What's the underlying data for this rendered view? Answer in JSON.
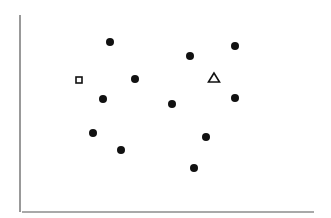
{
  "chart_data": {
    "type": "scatter",
    "title": "",
    "xlabel": "",
    "ylabel": "",
    "grid": false,
    "legend": null,
    "axes": {
      "y_axis": {
        "x": 20,
        "y1": 15,
        "y2": 212
      },
      "x_axis": {
        "y": 212,
        "x1": 22,
        "x2": 314
      },
      "color": "#555555"
    },
    "series": [
      {
        "name": "filled-circles",
        "marker": "circle",
        "color": "#111111",
        "points": [
          {
            "x": 110,
            "y": 42
          },
          {
            "x": 190,
            "y": 56
          },
          {
            "x": 235,
            "y": 46
          },
          {
            "x": 135,
            "y": 79
          },
          {
            "x": 103,
            "y": 99
          },
          {
            "x": 172,
            "y": 104
          },
          {
            "x": 235,
            "y": 98
          },
          {
            "x": 93,
            "y": 133
          },
          {
            "x": 121,
            "y": 150
          },
          {
            "x": 206,
            "y": 137
          },
          {
            "x": 194,
            "y": 168
          }
        ]
      },
      {
        "name": "open-square",
        "marker": "square",
        "color": "#111111",
        "points": [
          {
            "x": 79,
            "y": 80
          }
        ]
      },
      {
        "name": "open-triangle",
        "marker": "triangle",
        "color": "#111111",
        "points": [
          {
            "x": 214,
            "y": 78
          }
        ]
      }
    ]
  }
}
